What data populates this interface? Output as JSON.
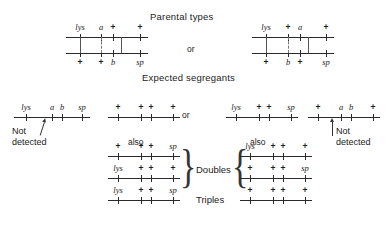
{
  "figure": {
    "title_parental": "Parental types",
    "title_segregants": "Expected segregants",
    "or_top": "or",
    "or_mid": "or",
    "also_left": "also",
    "also_right": "also",
    "doubles_label": "Doubles",
    "triples_label": "Triples",
    "not_detected_left": "Not\ndetected",
    "not_detected_right": "Not\ndetected",
    "not_detected_left_line1": "Not",
    "not_detected_left_line2": "detected",
    "not_detected_right_line1": "Not",
    "not_detected_right_line2": "detected",
    "line_color": "#2a2a2a",
    "text_color": "#1a1a1a",
    "background": "#ffffff"
  },
  "parental": {
    "left": {
      "top_alleles": [
        "lys",
        "a",
        "+",
        "+"
      ],
      "bottom_alleles": [
        "+",
        "+",
        "b",
        "sp"
      ],
      "connectors": [
        "solid",
        "dashed",
        "solid"
      ]
    },
    "right": {
      "top_alleles": [
        "lys",
        "+",
        "a",
        "+"
      ],
      "bottom_alleles": [
        "+",
        "b",
        "+",
        "sp"
      ],
      "connectors": [
        "solid",
        "dashed",
        "solid"
      ]
    }
  },
  "segregants": {
    "left_undetected": {
      "alleles": [
        "lys",
        "a",
        "b",
        "sp"
      ],
      "note_line1": "Not",
      "note_line2": "detected"
    },
    "right_undetected": {
      "alleles": [
        "+",
        "a",
        "b",
        "+"
      ],
      "note_line1": "Not",
      "note_line2": "detected"
    },
    "center_left_single": {
      "alleles": [
        "+",
        "+",
        "+",
        "+"
      ]
    },
    "center_right_single": {
      "alleles": [
        "lys",
        "+",
        "+",
        "sp"
      ]
    },
    "left_doubles": [
      {
        "alleles": [
          "+",
          "+",
          "+",
          "sp"
        ]
      },
      {
        "alleles": [
          "lys",
          "+",
          "+",
          "+"
        ]
      }
    ],
    "right_doubles": [
      {
        "alleles": [
          "lys",
          "+",
          "+",
          "+"
        ]
      },
      {
        "alleles": [
          "+",
          "+",
          "+",
          "sp"
        ]
      }
    ],
    "left_triples": {
      "alleles": [
        "lys",
        "+",
        "+",
        "sp"
      ]
    },
    "right_triples": {
      "alleles": [
        "+",
        "+",
        "+",
        "+"
      ]
    }
  }
}
